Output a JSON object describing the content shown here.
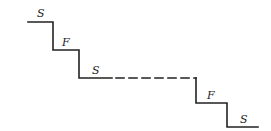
{
  "diagram": {
    "type": "staircase",
    "stroke_color": "#222222",
    "background": "#ffffff",
    "steps": [
      {
        "label": "S",
        "x1": 28,
        "x2": 53,
        "y": 22,
        "style": "solid"
      },
      {
        "label": "F",
        "x1": 53,
        "x2": 79,
        "y": 50,
        "style": "solid"
      },
      {
        "label": "S",
        "x1": 79,
        "x2": 112,
        "y": 78,
        "style": "solid"
      },
      {
        "label": "F",
        "x1": 196,
        "x2": 227,
        "y": 103,
        "style": "solid"
      },
      {
        "label": "S",
        "x1": 227,
        "x2": 258,
        "y": 127,
        "style": "solid"
      }
    ],
    "gap": {
      "x1": 113,
      "x2": 196,
      "y": 78,
      "style": "dashed"
    },
    "labels": [
      "S",
      "F",
      "S",
      "F",
      "S"
    ]
  }
}
